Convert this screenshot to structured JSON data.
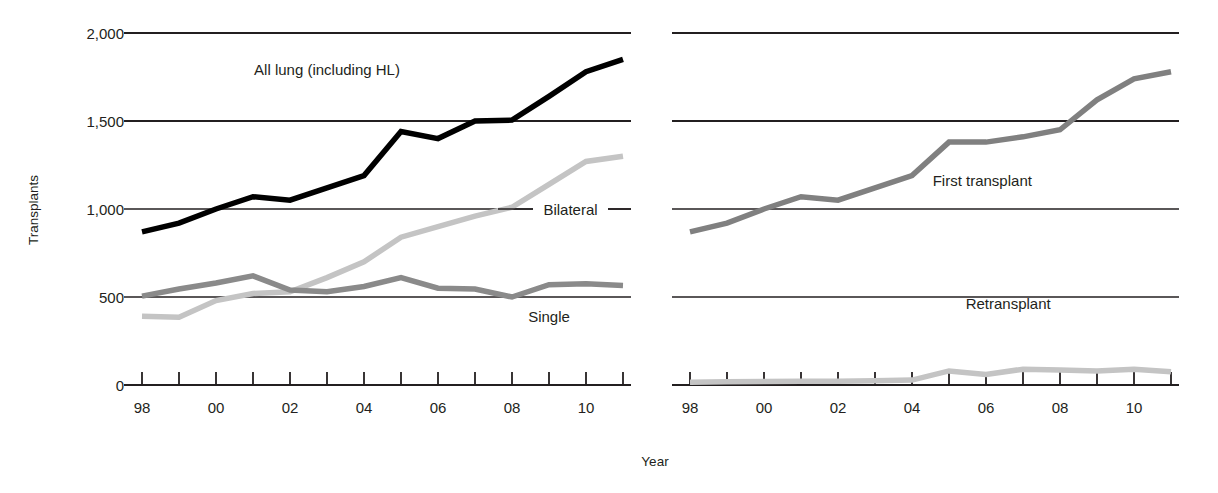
{
  "figure": {
    "background": "#ffffff",
    "ylabel": "Transplants",
    "xlabel": "Year"
  },
  "chart_data": [
    {
      "type": "line",
      "id": "left-panel",
      "title": "",
      "xlabel": "Year",
      "ylabel": "Transplants",
      "x": [
        "98",
        "99",
        "00",
        "01",
        "02",
        "03",
        "04",
        "05",
        "06",
        "07",
        "08",
        "09",
        "10",
        "11"
      ],
      "tick_labels_shown": [
        "98",
        "",
        "00",
        "",
        "02",
        "",
        "04",
        "",
        "06",
        "",
        "08",
        "",
        "10",
        ""
      ],
      "xlim": [
        1998,
        2011
      ],
      "ylim": [
        0,
        2000
      ],
      "yticks": [
        0,
        500,
        1000,
        1500,
        2000
      ],
      "ytick_labels": [
        "0",
        "500",
        "1,000",
        "1,500",
        "2,000"
      ],
      "grid": "horizontal",
      "legend": "inline-annotations",
      "series": [
        {
          "name": "All lung (including HL)",
          "color": "#000000",
          "width": 5.5,
          "values": [
            870,
            920,
            1000,
            1070,
            1050,
            1120,
            1190,
            1440,
            1400,
            1500,
            1505,
            1640,
            1780,
            1850
          ],
          "label_x": 2003.0,
          "label_y": 1760
        },
        {
          "name": "Bilateral",
          "color": "#c4c4c4",
          "width": 5.5,
          "values": [
            390,
            385,
            480,
            520,
            530,
            610,
            700,
            840,
            900,
            960,
            1010,
            1140,
            1270,
            1300
          ],
          "label_x": 2009.4,
          "label_y": 1000
        },
        {
          "name": "Single",
          "color": "#8a8a8a",
          "width": 5.5,
          "values": [
            505,
            545,
            580,
            620,
            540,
            530,
            560,
            610,
            550,
            545,
            500,
            570,
            575,
            565
          ],
          "label_x": 2009.0,
          "label_y": 360
        }
      ]
    },
    {
      "type": "line",
      "id": "right-panel",
      "title": "",
      "xlabel": "Year",
      "ylabel": "Transplants",
      "x": [
        "98",
        "99",
        "00",
        "01",
        "02",
        "03",
        "04",
        "05",
        "06",
        "07",
        "08",
        "09",
        "10",
        "11"
      ],
      "tick_labels_shown": [
        "98",
        "",
        "00",
        "",
        "02",
        "",
        "04",
        "",
        "06",
        "",
        "08",
        "",
        "10",
        ""
      ],
      "xlim": [
        1998,
        2011
      ],
      "ylim": [
        0,
        2000
      ],
      "yticks": [
        0,
        500,
        1000,
        1500,
        2000
      ],
      "grid": "horizontal",
      "legend": "inline-annotations",
      "series": [
        {
          "name": "First transplant",
          "color": "#808080",
          "width": 5.5,
          "values": [
            870,
            920,
            1000,
            1070,
            1050,
            1120,
            1190,
            1380,
            1380,
            1410,
            1450,
            1620,
            1740,
            1780
          ],
          "label_x": 2005.9,
          "label_y": 1130
        },
        {
          "name": "Retransplant",
          "color": "#c4c4c4",
          "width": 5.5,
          "values": [
            15,
            18,
            20,
            22,
            22,
            24,
            28,
            80,
            60,
            90,
            85,
            80,
            90,
            75
          ],
          "label_x": 2006.6,
          "label_y": 430
        }
      ]
    }
  ],
  "annotations": {
    "bilateral_leader": "line-segments-both-sides"
  }
}
